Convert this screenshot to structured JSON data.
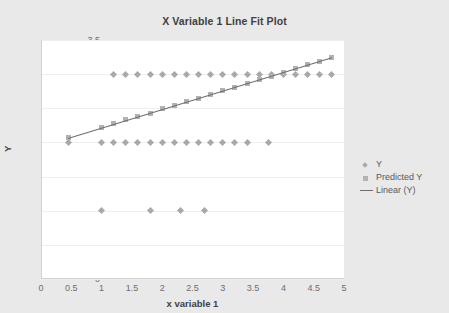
{
  "page": {
    "background_color": "#e9e9e9",
    "truncated_top_text": [
      "...",
      "...",
      "..."
    ]
  },
  "legend": {
    "position": "right",
    "items": [
      {
        "label": "Y",
        "marker": "diamond-marker-icon",
        "color": "#a7a9ac"
      },
      {
        "label": "Predicted Y",
        "marker": "square-marker-icon",
        "color": "#b0b2b5"
      },
      {
        "label": "Linear (Y)",
        "marker": "line-marker-icon",
        "color": "#6d6e71"
      }
    ]
  },
  "chart_data": {
    "type": "scatter",
    "title": "X Variable 1 Line Fit Plot",
    "xlabel": "x variable 1",
    "ylabel": "Y",
    "xlim": [
      0,
      5
    ],
    "ylim": [
      0,
      3.5
    ],
    "xticks": [
      0,
      0.5,
      1,
      1.5,
      2,
      2.5,
      3,
      3.5,
      4,
      4.5,
      5
    ],
    "yticks": [
      0,
      0.5,
      1,
      1.5,
      2,
      2.5,
      3,
      3.5
    ],
    "grid": true,
    "grid_axis": "y",
    "legend_position": "right",
    "series": [
      {
        "name": "Y",
        "type": "scatter",
        "marker": "diamond",
        "color": "#a7a9ac",
        "points": [
          [
            0.45,
            2.0
          ],
          [
            1.0,
            2.0
          ],
          [
            1.2,
            2.0
          ],
          [
            1.4,
            2.0
          ],
          [
            1.6,
            2.0
          ],
          [
            1.8,
            2.0
          ],
          [
            2.0,
            2.0
          ],
          [
            2.2,
            2.0
          ],
          [
            2.4,
            2.0
          ],
          [
            2.6,
            2.0
          ],
          [
            2.8,
            2.0
          ],
          [
            3.0,
            2.0
          ],
          [
            3.2,
            2.0
          ],
          [
            3.4,
            2.0
          ],
          [
            3.75,
            2.0
          ],
          [
            1.2,
            3.0
          ],
          [
            1.4,
            3.0
          ],
          [
            1.6,
            3.0
          ],
          [
            1.8,
            3.0
          ],
          [
            2.0,
            3.0
          ],
          [
            2.2,
            3.0
          ],
          [
            2.4,
            3.0
          ],
          [
            2.6,
            3.0
          ],
          [
            2.8,
            3.0
          ],
          [
            3.0,
            3.0
          ],
          [
            3.2,
            3.0
          ],
          [
            3.4,
            3.0
          ],
          [
            3.6,
            3.0
          ],
          [
            3.8,
            3.0
          ],
          [
            4.0,
            3.0
          ],
          [
            4.2,
            3.0
          ],
          [
            4.4,
            3.0
          ],
          [
            4.6,
            3.0
          ],
          [
            4.8,
            3.0
          ],
          [
            1.0,
            1.0
          ],
          [
            1.8,
            1.0
          ],
          [
            2.3,
            1.0
          ],
          [
            2.7,
            1.0
          ]
        ]
      },
      {
        "name": "Predicted Y",
        "type": "scatter",
        "marker": "square",
        "color": "#b0b2b5",
        "points": [
          [
            0.45,
            2.07
          ],
          [
            1.0,
            2.22
          ],
          [
            1.2,
            2.27
          ],
          [
            1.4,
            2.33
          ],
          [
            1.6,
            2.38
          ],
          [
            1.8,
            2.43
          ],
          [
            2.0,
            2.49
          ],
          [
            2.2,
            2.54
          ],
          [
            2.4,
            2.6
          ],
          [
            2.6,
            2.65
          ],
          [
            2.8,
            2.7
          ],
          [
            3.0,
            2.76
          ],
          [
            3.2,
            2.81
          ],
          [
            3.4,
            2.87
          ],
          [
            3.6,
            2.92
          ],
          [
            3.8,
            2.97
          ],
          [
            4.0,
            3.03
          ],
          [
            4.2,
            3.08
          ],
          [
            4.4,
            3.14
          ],
          [
            4.6,
            3.19
          ],
          [
            4.8,
            3.25
          ]
        ]
      },
      {
        "name": "Linear (Y)",
        "type": "line",
        "color": "#6d6e71",
        "endpoints": [
          [
            0.45,
            2.07
          ],
          [
            4.8,
            3.25
          ]
        ]
      }
    ]
  }
}
